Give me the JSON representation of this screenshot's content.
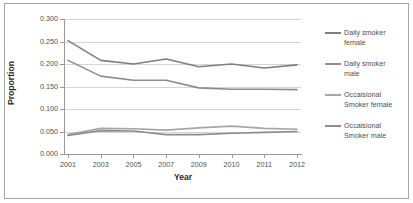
{
  "chart_data": {
    "type": "line",
    "title": "",
    "xlabel": "Year",
    "ylabel": "Proportion",
    "categories": [
      "2001",
      "2003",
      "2005",
      "2007",
      "2009",
      "2010",
      "2011",
      "2012"
    ],
    "x": [
      2001,
      2003,
      2005,
      2007,
      2009,
      2010,
      2011,
      2012
    ],
    "ylim": [
      0.0,
      0.3
    ],
    "yticks": [
      "0.000",
      "0.050",
      "0.100",
      "0.150",
      "0.200",
      "0.250",
      "0.300"
    ],
    "ytick_values": [
      0.0,
      0.05,
      0.1,
      0.15,
      0.2,
      0.25,
      0.3
    ],
    "grid": true,
    "legend_position": "right",
    "series": [
      {
        "name": "Daily smoker female",
        "legend_label": "Daily smoker\nfemale",
        "color": "#7f7f7f",
        "values": [
          0.252,
          0.208,
          0.2,
          0.211,
          0.194,
          0.2,
          0.191,
          0.198
        ]
      },
      {
        "name": "Daily smoker male",
        "legend_label": "Daily smoker\nmale",
        "color": "#8c8c8c",
        "values": [
          0.208,
          0.173,
          0.164,
          0.164,
          0.147,
          0.144,
          0.144,
          0.143
        ]
      },
      {
        "name": "Occaisional Smoker female",
        "legend_label": "Occaisional\nSmoker female",
        "color": "#a6a6a6",
        "values": [
          0.043,
          0.057,
          0.056,
          0.053,
          0.058,
          0.062,
          0.057,
          0.055
        ]
      },
      {
        "name": "Occaisional Smoker male",
        "legend_label": "Occaisional\nSmoker male",
        "color": "#8c8c8c",
        "values": [
          0.041,
          0.052,
          0.051,
          0.043,
          0.043,
          0.046,
          0.048,
          0.05
        ]
      }
    ]
  },
  "axes": {
    "y_title": "Proportion",
    "x_title": "Year"
  },
  "colors": {
    "gridline": "#d4d4d4",
    "axis": "#9a9a9a",
    "frame": "#a6a6a6",
    "tick_text": "#4f4f4f",
    "title_text": "#2b2b2b"
  }
}
